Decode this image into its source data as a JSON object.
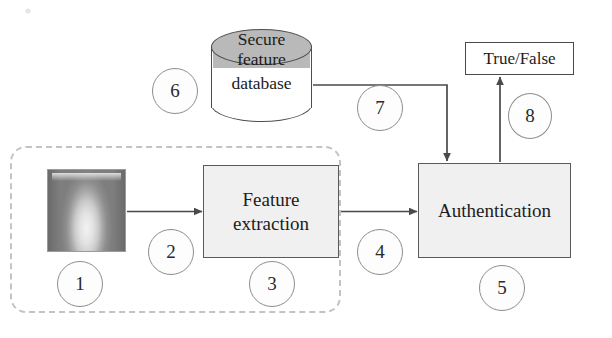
{
  "diagram": {
    "nodes": {
      "sample_image": {
        "name": "fingerprint-sample",
        "alt": "grayscale fingerprint scan"
      },
      "feature_extraction": {
        "label": "Feature\nextraction",
        "line1": "Feature",
        "line2": "extraction"
      },
      "authentication": {
        "label": "Authentication"
      },
      "result": {
        "label": "True/False"
      },
      "database": {
        "line1": "Secure",
        "line2": "feature",
        "line3": "database"
      }
    },
    "steps": [
      {
        "id": 1,
        "label": "1",
        "refers_to": "fingerprint-sample"
      },
      {
        "id": 2,
        "label": "2",
        "refers_to": "arrow-sample-to-feature"
      },
      {
        "id": 3,
        "label": "3",
        "refers_to": "feature-extraction-box"
      },
      {
        "id": 4,
        "label": "4",
        "refers_to": "arrow-feature-to-auth"
      },
      {
        "id": 5,
        "label": "5",
        "refers_to": "authentication-box"
      },
      {
        "id": 6,
        "label": "6",
        "refers_to": "secure-feature-database"
      },
      {
        "id": 7,
        "label": "7",
        "refers_to": "arrow-database-to-auth"
      },
      {
        "id": 8,
        "label": "8",
        "refers_to": "arrow-auth-to-result"
      }
    ],
    "colors": {
      "box_fill": "#f0f0f0",
      "box_border": "#5a5a5a",
      "database_top_fill": "#b9b9b9",
      "database_body_fill": "#ffffff",
      "dashed_region_border": "#c3c3c3",
      "arrow_stroke": "#4a4a4a",
      "circle_border": "#8d8d8d",
      "text": "#1c1c1c",
      "background": "#ffffff"
    },
    "regions": {
      "capture_region": {
        "name": "enrollment-capture-region",
        "style": "dashed rounded rectangle"
      }
    }
  }
}
